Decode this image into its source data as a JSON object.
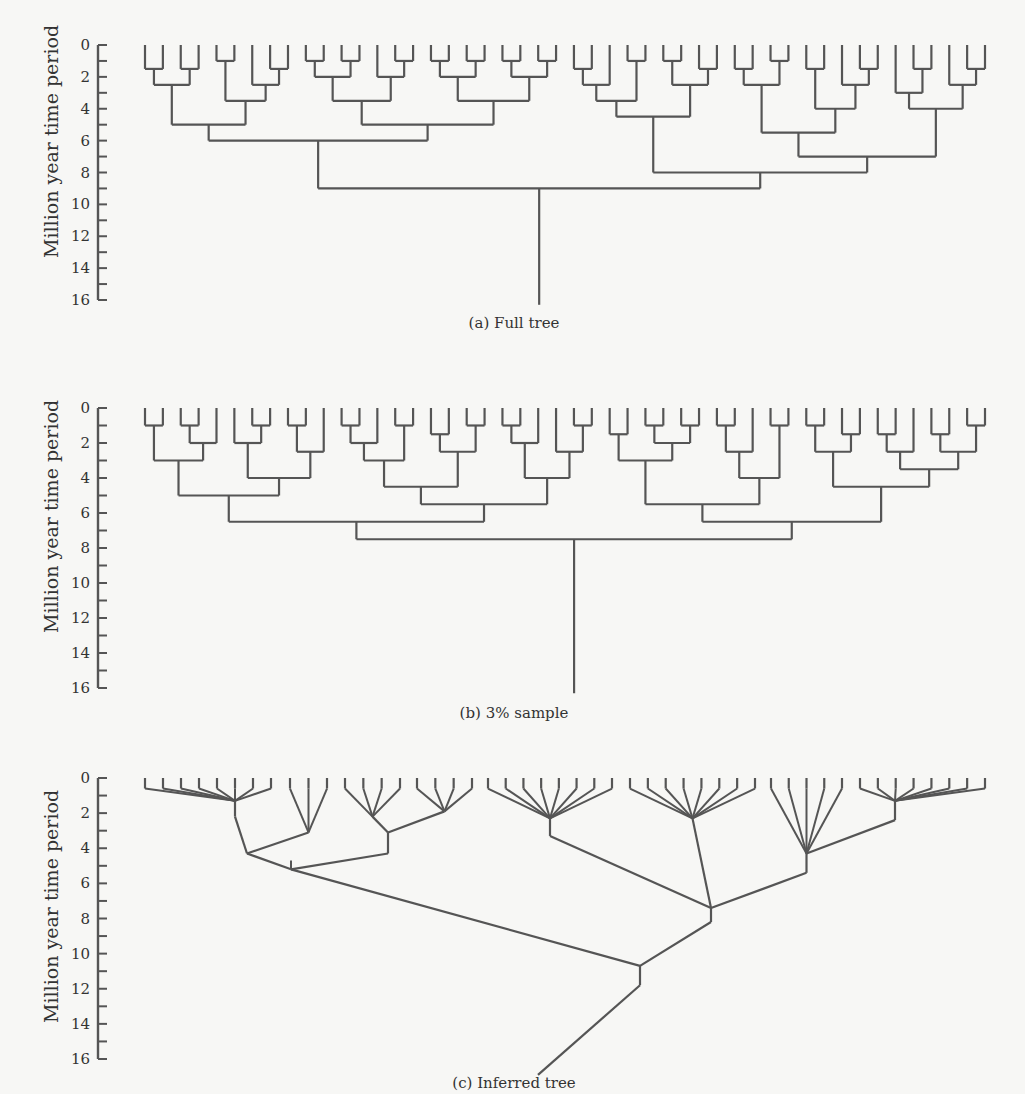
{
  "figure": {
    "panels": [
      {
        "id": "a",
        "caption": "(a)  Full tree",
        "ylabel": "Million year time period",
        "y0": 45,
        "y16": 300,
        "caption_y": 314
      },
      {
        "id": "b",
        "caption": "(b)  3% sample",
        "ylabel": "Million year time period",
        "y0": 408,
        "y16": 688,
        "caption_y": 705
      },
      {
        "id": "c",
        "caption": "(c)  Inferred tree",
        "ylabel": "Million year time period",
        "y0": 778,
        "y16": 1059,
        "caption_y": 1072
      }
    ],
    "axis": {
      "ticks": [
        0,
        1,
        2,
        3,
        4,
        5,
        6,
        7,
        8,
        9,
        10,
        11,
        12,
        13,
        14,
        15,
        16
      ],
      "labels": [
        "0",
        "2",
        "4",
        "6",
        "8",
        "10",
        "12",
        "14",
        "16"
      ],
      "label_values": [
        0,
        2,
        4,
        6,
        8,
        10,
        12,
        14,
        16
      ],
      "x": 98
    },
    "line_color": "#555555",
    "leaf_count": 48,
    "leaf_x_start": 145,
    "leaf_x_end": 985
  },
  "chart_data": [
    {
      "type": "tree",
      "title": "(a) Full tree",
      "ylabel": "Million year time period",
      "ylim": [
        0,
        16
      ],
      "leaves": 48,
      "root_depth": 16,
      "structure": "rectangular binary phylogeny, leaves at t=0, root at t≈16"
    },
    {
      "type": "tree",
      "title": "(b) 3% sample",
      "ylabel": "Million year time period",
      "ylim": [
        0,
        16
      ],
      "leaves": 48,
      "root_depth": 16,
      "structure": "rectangular binary phylogeny (sampled), leaves at t=0, root at t≈16"
    },
    {
      "type": "tree",
      "title": "(c) Inferred tree",
      "ylabel": "Million year time period",
      "ylim": [
        0,
        16
      ],
      "structure": "multifurcating inferred tree",
      "groups": [
        {
          "leaves": 8,
          "node_depth": 1.3,
          "x_range": [
            145,
            271
          ]
        },
        {
          "leaves": 3,
          "node_depth": 3.1,
          "x_range": [
            290,
            327
          ]
        },
        {
          "leaves": 4,
          "node_depth": 2.2,
          "x_range": [
            345,
            400
          ]
        },
        {
          "leaves": 4,
          "node_depth": 1.9,
          "x_range": [
            417,
            472
          ]
        },
        {
          "leaves": 8,
          "node_depth": 2.3,
          "x_range": [
            488,
            612
          ]
        },
        {
          "leaves": 8,
          "node_depth": 2.3,
          "x_range": [
            630,
            755
          ]
        },
        {
          "leaves": 5,
          "node_depth": 4.3,
          "x_range": [
            771,
            842
          ]
        },
        {
          "leaves": 8,
          "node_depth": 1.3,
          "x_range": [
            860,
            985
          ]
        }
      ],
      "internal_nodes": [
        {
          "name": "n_left",
          "depth": 4.3
        },
        {
          "name": "n_mid_left",
          "depth": 3.1
        },
        {
          "name": "n_A",
          "depth": 5.2
        },
        {
          "name": "n_right",
          "depth": 7.4
        },
        {
          "name": "n_root_join",
          "depth": 10.7
        },
        {
          "name": "root",
          "depth": 16
        }
      ]
    }
  ]
}
